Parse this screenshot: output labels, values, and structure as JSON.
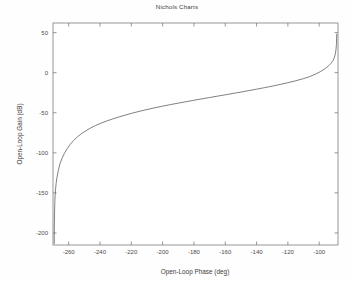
{
  "figure": {
    "title": "Nichols Charts",
    "background_color": "#fefefe",
    "plot_background_color": "#ffffff",
    "axis_color": "#6b6b6b",
    "line_color": "#555555"
  },
  "chart_data": {
    "type": "line",
    "title": "Nichols Charts",
    "xlabel": "Open-Loop Phase (deg)",
    "ylabel": "Open-Loop Gain (dB)",
    "xlim": [
      -270,
      -88
    ],
    "ylim": [
      -215,
      62
    ],
    "xticks": [
      -260,
      -240,
      -220,
      -200,
      -180,
      -160,
      -140,
      -120,
      -100
    ],
    "yticks": [
      50,
      0,
      -50,
      -100,
      -150,
      -200
    ],
    "xtick_labels": [
      "-260",
      "-240",
      "-220",
      "-200",
      "-180",
      "-160",
      "-140",
      "-120",
      "-100"
    ],
    "ytick_labels": [
      "50",
      "0",
      "-50",
      "-100",
      "-150",
      "-200"
    ],
    "grid": false,
    "legend": null,
    "series": [
      {
        "name": "open-loop response",
        "x": [
          -269.2,
          -269.2,
          -269.1,
          -269.0,
          -268.9,
          -268.7,
          -268.4,
          -268.0,
          -267.4,
          -266.6,
          -265.6,
          -264.3,
          -262.8,
          -261.0,
          -259.0,
          -256.8,
          -254.4,
          -251.8,
          -249.0,
          -246.0,
          -243.0,
          -240.0,
          -236.0,
          -232.0,
          -228.0,
          -224.0,
          -220.0,
          -215.0,
          -210.0,
          -205.0,
          -200.0,
          -195.0,
          -190.0,
          -185.0,
          -180.0,
          -175.0,
          -170.0,
          -165.0,
          -160.0,
          -155.0,
          -150.0,
          -145.0,
          -140.0,
          -135.0,
          -130.0,
          -125.0,
          -120.0,
          -115.0,
          -110.0,
          -106.0,
          -102.0,
          -99.0,
          -96.0,
          -94.0,
          -92.5,
          -91.2,
          -90.3,
          -89.7,
          -89.3,
          -89.0,
          -88.8
        ],
        "y": [
          -213.0,
          -200.0,
          -186.0,
          -175.0,
          -165.0,
          -155.0,
          -146.0,
          -138.0,
          -130.0,
          -122.0,
          -114.0,
          -107.0,
          -101.0,
          -95.0,
          -89.5,
          -84.5,
          -80.0,
          -76.0,
          -72.5,
          -69.0,
          -66.0,
          -63.5,
          -60.5,
          -57.8,
          -55.3,
          -53.0,
          -50.8,
          -48.3,
          -46.0,
          -43.8,
          -41.8,
          -39.8,
          -38.0,
          -36.2,
          -34.4,
          -32.7,
          -31.0,
          -29.3,
          -27.6,
          -25.9,
          -24.2,
          -22.4,
          -20.6,
          -18.7,
          -16.8,
          -14.7,
          -12.5,
          -10.1,
          -7.4,
          -4.8,
          -1.5,
          1.6,
          5.4,
          8.6,
          11.6,
          15.0,
          19.0,
          23.5,
          28.5,
          35.0,
          48.0
        ]
      }
    ]
  }
}
